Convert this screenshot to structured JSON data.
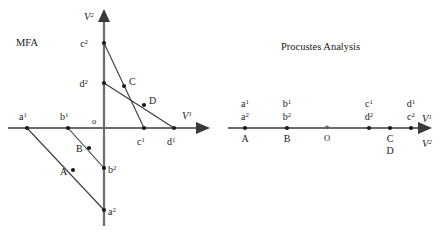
{
  "figure": {
    "background_color": "#ffffff",
    "axis_color": "#6b6b6b",
    "connector_color": "#3a3a3a",
    "point_color": "#1a1a1a"
  },
  "left_panel": {
    "title": "MFA",
    "origin_label": "o",
    "x_axis_label_base": "V",
    "x_axis_label_sup": "1",
    "y_axis_label_base": "V",
    "y_axis_label_sup": "2",
    "points": [
      {
        "name": "a1",
        "base": "a",
        "sup": "1",
        "x": 27,
        "y": 128
      },
      {
        "name": "b1",
        "base": "b",
        "sup": "1",
        "x": 68,
        "y": 128
      },
      {
        "name": "c1",
        "base": "c",
        "sup": "1",
        "x": 144,
        "y": 128
      },
      {
        "name": "d1",
        "base": "d",
        "sup": "1",
        "x": 174,
        "y": 128
      },
      {
        "name": "a2",
        "base": "a",
        "sup": "2",
        "x": 104,
        "y": 210
      },
      {
        "name": "b2",
        "base": "b",
        "sup": "2",
        "x": 104,
        "y": 168
      },
      {
        "name": "c2",
        "base": "c",
        "sup": "2",
        "x": 104,
        "y": 43
      },
      {
        "name": "d2",
        "base": "d",
        "sup": "2",
        "x": 104,
        "y": 83
      },
      {
        "name": "A",
        "base": "A",
        "sup": "",
        "x": 73,
        "y": 170
      },
      {
        "name": "B",
        "base": "B",
        "sup": "",
        "x": 89,
        "y": 148
      },
      {
        "name": "C",
        "base": "C",
        "sup": "",
        "x": 124,
        "y": 86
      },
      {
        "name": "D",
        "base": "D",
        "sup": "",
        "x": 144,
        "y": 105
      }
    ],
    "compromise_labels": [
      "A",
      "B",
      "C",
      "D"
    ],
    "connectors": [
      {
        "from": "a1",
        "to": "a2"
      },
      {
        "from": "b1",
        "to": "b2"
      },
      {
        "from": "c2",
        "to": "c1"
      },
      {
        "from": "d2",
        "to": "d1"
      }
    ]
  },
  "right_panel": {
    "title": "Procustes Analysis",
    "origin_label": "O",
    "origin_cross": "+",
    "x_axis_label_base": "V",
    "x_axis_label_sup": "1",
    "y_axis_label_base": "V",
    "y_axis_label_sup": "2",
    "points": [
      {
        "name": "A",
        "x": 245,
        "y": 128,
        "above": [
          {
            "base": "a",
            "sup": "1"
          },
          {
            "base": "a",
            "sup": "2"
          }
        ],
        "below": [
          "A"
        ]
      },
      {
        "name": "B",
        "x": 287,
        "y": 128,
        "above": [
          {
            "base": "b",
            "sup": "1"
          },
          {
            "base": "b",
            "sup": "2"
          }
        ],
        "below": [
          "B"
        ]
      },
      {
        "name": "CD-left",
        "x": 369,
        "y": 128,
        "above": [
          {
            "base": "c",
            "sup": "1"
          },
          {
            "base": "d",
            "sup": "2"
          }
        ],
        "below": []
      },
      {
        "name": "CD-mid",
        "x": 390,
        "y": 128,
        "above": [],
        "below": [
          "C",
          "D"
        ]
      },
      {
        "name": "CD-right",
        "x": 411,
        "y": 128,
        "above": [
          {
            "base": "d",
            "sup": "1"
          },
          {
            "base": "c",
            "sup": "2"
          }
        ],
        "below": []
      }
    ],
    "origin_x": 327
  }
}
